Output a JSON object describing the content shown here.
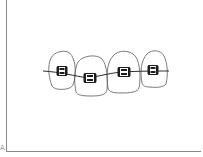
{
  "figure": {
    "colors": {
      "background": "#ffffff",
      "outline": "#5a5a5a",
      "wire": "#2e2e2e",
      "bracket": "#1e1e1e",
      "frame": "#8a8a8a"
    },
    "teeth_count": 4,
    "brackets_count": 4,
    "corner_mark": "A"
  }
}
